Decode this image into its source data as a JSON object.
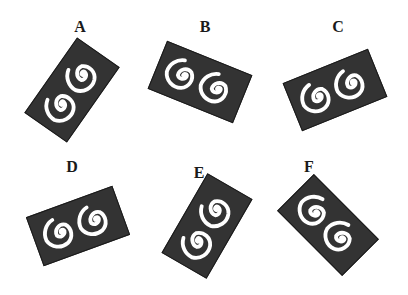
{
  "colors": {
    "tile": "#333333",
    "spiral": "#ffffff",
    "label": "#1a1a1a",
    "background": "#ffffff"
  },
  "options": [
    {
      "label": "A",
      "label_pos": [
        80,
        27
      ],
      "center": [
        72,
        90
      ],
      "rotation_deg": -55
    },
    {
      "label": "B",
      "label_pos": [
        205,
        27
      ],
      "center": [
        200,
        82
      ],
      "rotation_deg": 22
    },
    {
      "label": "C",
      "label_pos": [
        338,
        27
      ],
      "center": [
        335,
        90
      ],
      "rotation_deg": -22
    },
    {
      "label": "D",
      "label_pos": [
        72,
        167
      ],
      "center": [
        78,
        226
      ],
      "rotation_deg": -20
    },
    {
      "label": "E",
      "label_pos": [
        199,
        173
      ],
      "center": [
        207,
        226
      ],
      "rotation_deg": -60
    },
    {
      "label": "F",
      "label_pos": [
        309,
        167
      ],
      "center": [
        328,
        225
      ],
      "rotation_deg": 45
    }
  ],
  "tile_icon": "double-spiral-icon"
}
